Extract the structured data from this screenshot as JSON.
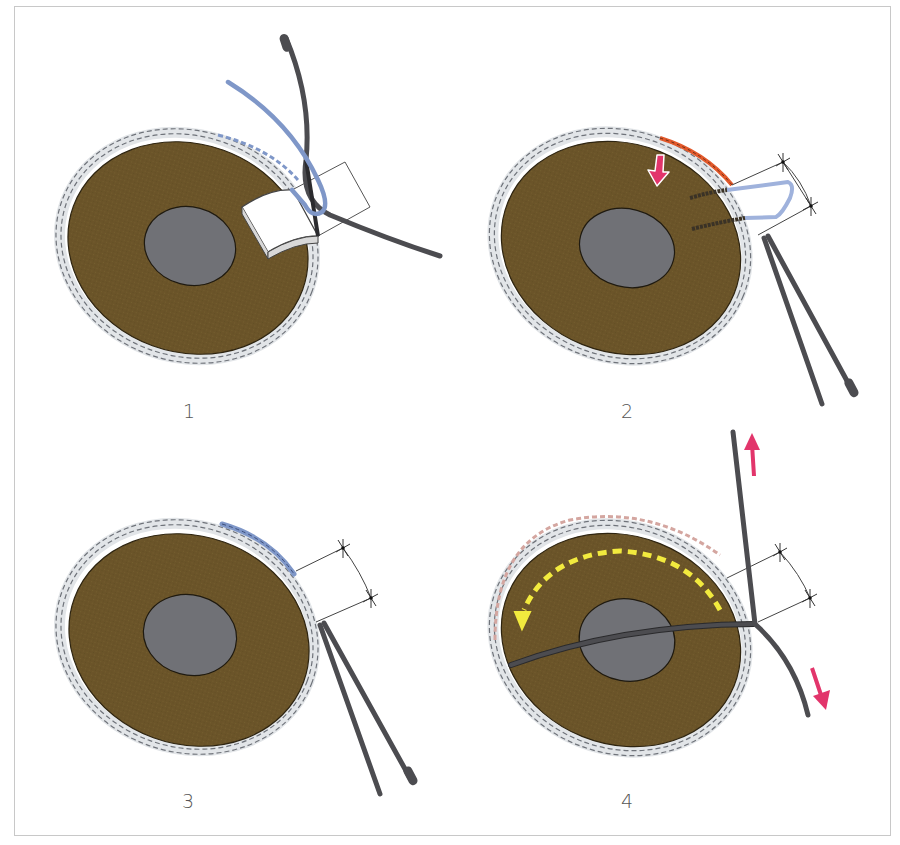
{
  "figure": {
    "panels": [
      {
        "id": 1,
        "label": "1",
        "step": "tube-and-pledget-insertion"
      },
      {
        "id": 2,
        "label": "2",
        "step": "suture-passed-push-arrow"
      },
      {
        "id": 3,
        "label": "3",
        "step": "sutured-closure"
      },
      {
        "id": 4,
        "label": "4",
        "step": "rotation-and-traction"
      }
    ]
  },
  "colors": {
    "tissue_brown": "#6b5429",
    "tissue_outline": "#2e2410",
    "center_gray": "#707176",
    "ring_gray": "#e2e5e8",
    "ring_dash": "#6f737a",
    "tube_dark": "#4c4c50",
    "tube_blue": "#7f97c8",
    "suture_orange": "#e2592b",
    "arrow_pink": "#e2356b",
    "arrow_yellow": "#f2ea3e",
    "ring_pink_dash": "#d4a6a0",
    "frame_border": "#c8c8c8",
    "label_text": "#555555"
  },
  "icons": {
    "push-arrow": "down-arrow",
    "pull-up-arrow": "up-arrow",
    "pull-down-arrow": "down-right-arrow",
    "rotation-arrow": "curved-dashed-arrow"
  }
}
